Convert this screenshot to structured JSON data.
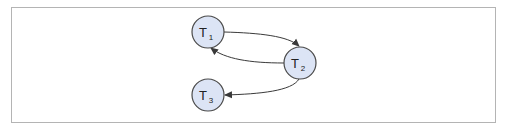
{
  "diagram": {
    "type": "directed-graph",
    "colors": {
      "node_fill": "#dce4f5",
      "node_stroke": "#4a4a4a",
      "edge_stroke": "#3a3a3a",
      "frame_border": "#b4b4b4"
    },
    "nodes": [
      {
        "id": "T1",
        "label": "T",
        "subscript": "1",
        "cx": 208,
        "cy": 32,
        "r": 16
      },
      {
        "id": "T2",
        "label": "T",
        "subscript": "2",
        "cx": 300,
        "cy": 63,
        "r": 16
      },
      {
        "id": "T3",
        "label": "T",
        "subscript": "3",
        "cx": 208,
        "cy": 95,
        "r": 16
      }
    ],
    "edges": [
      {
        "from": "T1",
        "to": "T2"
      },
      {
        "from": "T2",
        "to": "T1"
      },
      {
        "from": "T2",
        "to": "T3"
      }
    ]
  }
}
